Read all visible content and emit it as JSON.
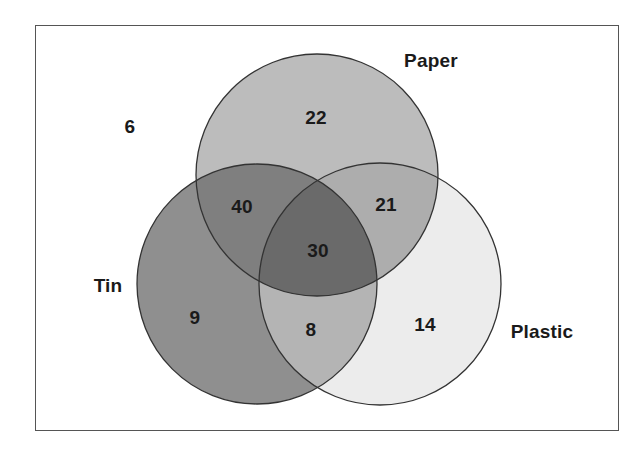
{
  "diagram": {
    "type": "venn-3",
    "sets": [
      {
        "name": "Paper",
        "fill": "#bdbdbd"
      },
      {
        "name": "Tin",
        "fill": "#8e8e8e"
      },
      {
        "name": "Plastic",
        "fill": "#ececec"
      }
    ],
    "regions": {
      "outside": "6",
      "paper_only": "22",
      "tin_only": "9",
      "plastic_only": "14",
      "paper_tin": "40",
      "paper_plastic": "21",
      "tin_plastic": "8",
      "all_three": "30"
    },
    "labels": {
      "paper": "Paper",
      "tin": "Tin",
      "plastic": "Plastic"
    }
  }
}
